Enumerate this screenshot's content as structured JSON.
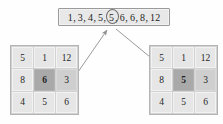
{
  "diagram": {
    "title_box": {
      "name": "sorted-list-box",
      "raw_text": "1, 3, 4, 5, 5, 6, 6, 8, 12",
      "tokens": [
        "1",
        "3",
        "4",
        "5",
        "5",
        "6",
        "6",
        "8",
        "12"
      ],
      "circled_index": 4,
      "circled_value": "5",
      "separator": ","
    },
    "grids": [
      {
        "name": "grid-left",
        "rows": [
          [
            "5",
            "1",
            "12"
          ],
          [
            "8",
            "6",
            "3"
          ],
          [
            "4",
            "5",
            "6"
          ]
        ],
        "highlight": {
          "row": 1,
          "col": 1,
          "value": "6"
        },
        "mid_shaded": [
          {
            "row": 1,
            "col": 2
          }
        ]
      },
      {
        "name": "grid-right",
        "rows": [
          [
            "5",
            "1",
            "12"
          ],
          [
            "8",
            "5",
            "3"
          ],
          [
            "4",
            "5",
            "6"
          ]
        ],
        "highlight": {
          "row": 1,
          "col": 1,
          "value": "5"
        },
        "mid_shaded": [
          {
            "row": 1,
            "col": 2
          }
        ]
      }
    ],
    "arrows": [
      {
        "name": "arrow-left-grid-to-list",
        "from": {
          "x": 78,
          "y": 72
        },
        "to": {
          "x": 107,
          "y": 29
        },
        "head_at": "to"
      },
      {
        "name": "arrow-list-to-right-grid",
        "from": {
          "x": 116,
          "y": 29
        },
        "to": {
          "x": 173,
          "y": 76
        },
        "head_at": "to"
      }
    ],
    "colors": {
      "box_fill": "#e8e8e8",
      "box_border": "#9a9a9a",
      "cell_fill": "#e6e6e6",
      "cell_mid": "#cfcfcf",
      "cell_highlight": "#a9a9a9",
      "grid_border": "#b4b4b4",
      "arrow": "#8f8f8f",
      "text": "#1c1c1c"
    }
  }
}
